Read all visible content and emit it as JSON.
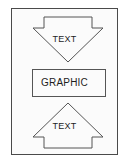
{
  "figure": {
    "background_color": "#ffffff",
    "frame_color": "#4a4a4a",
    "frame_fill": "#fbfbfb",
    "shape_stroke_color": "#555555",
    "text_color": "#1d1d1d",
    "elements": {
      "top_arrow": {
        "shape": "down-arrow",
        "label": "TEXT",
        "direction": "down"
      },
      "middle_box": {
        "shape": "rectangle",
        "label": "GRAPHIC"
      },
      "bottom_arrow": {
        "shape": "up-arrow",
        "label": "TEXT",
        "direction": "up"
      }
    }
  }
}
